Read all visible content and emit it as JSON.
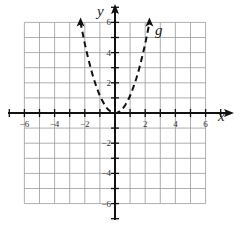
{
  "chart_data": {
    "type": "line",
    "title": "",
    "xlabel": "x",
    "ylabel": "y",
    "xlim": [
      -6,
      6
    ],
    "ylim": [
      -6,
      6
    ],
    "grid": true,
    "x_ticks": [
      -6,
      -4,
      -2,
      2,
      4,
      6
    ],
    "y_ticks": [
      -6,
      -4,
      -2,
      2,
      4,
      6
    ],
    "x_tick_labels": [
      "−6",
      "−4",
      "−2",
      "2",
      "4",
      "6"
    ],
    "y_tick_labels": [
      "−6",
      "−4",
      "−2",
      "2",
      "4",
      "6"
    ],
    "series": [
      {
        "name": "g",
        "style": "dashed",
        "arrows": "both ends",
        "x": [
          -2.2,
          -2,
          -1.5,
          -1,
          -0.5,
          0,
          0.5,
          1,
          1.5,
          2,
          2.2
        ],
        "y": [
          6,
          4.8,
          2.7,
          1.2,
          0.3,
          0,
          0.3,
          1.2,
          2.7,
          4.8,
          6
        ]
      }
    ],
    "annotations": [
      "g"
    ]
  },
  "labels": {
    "x": "x",
    "y": "y",
    "curve": "g"
  }
}
